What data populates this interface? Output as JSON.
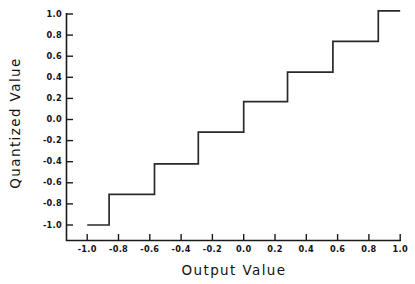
{
  "chart_data": {
    "type": "line",
    "title": "",
    "xlabel": "Output Value",
    "ylabel": "Quantized Value",
    "xlim": [
      -1.12,
      1.06
    ],
    "ylim": [
      -1.12,
      1.06
    ],
    "grid": false,
    "legend": "none",
    "xticks": [
      "-1.0",
      "-0.8",
      "-0.6",
      "-0.4",
      "-0.2",
      "0.0",
      "0.2",
      "0.4",
      "0.6",
      "0.8",
      "1.0"
    ],
    "xtick_values": [
      -1.0,
      -0.8,
      -0.6,
      -0.4,
      -0.2,
      0.0,
      0.2,
      0.4,
      0.6,
      0.8,
      1.0
    ],
    "yticks": [
      "1.0",
      "0.8",
      "0.6",
      "0.4",
      "0.2",
      "0.0",
      "-0.2",
      "-0.4",
      "-0.6",
      "-0.8",
      "-1.0"
    ],
    "ytick_values": [
      1.0,
      0.8,
      0.6,
      0.4,
      0.2,
      0.0,
      -0.2,
      -0.4,
      -0.6,
      -0.8,
      -1.0
    ],
    "series": [
      {
        "name": "quantizer staircase",
        "style": "step-post",
        "color": "#2a2a2a",
        "x": [
          -1.0,
          -0.86,
          -0.86,
          -0.57,
          -0.57,
          -0.29,
          -0.29,
          0.0,
          0.0,
          0.28,
          0.28,
          0.57,
          0.57,
          0.86,
          0.86,
          1.0
        ],
        "y": [
          -1.0,
          -1.0,
          -0.71,
          -0.71,
          -0.42,
          -0.42,
          -0.12,
          -0.12,
          0.17,
          0.17,
          0.45,
          0.45,
          0.74,
          0.74,
          1.03,
          1.03
        ]
      }
    ],
    "step_levels": [
      -1.0,
      -0.71,
      -0.42,
      -0.12,
      0.17,
      0.45,
      0.74,
      1.03
    ],
    "step_breakpoints": [
      -0.86,
      -0.57,
      -0.29,
      0.0,
      0.28,
      0.57,
      0.86
    ],
    "num_levels": 8
  },
  "axes": {
    "y_axis_title": "Quantized Value",
    "x_axis_title": "Output Value"
  }
}
